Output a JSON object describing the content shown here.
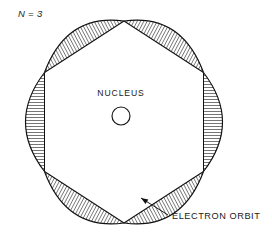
{
  "figure": {
    "title_label": "N = 3",
    "nucleus_label": "NUCLEUS",
    "orbit_label": "ELECTRON ORBIT",
    "background_color": "#ffffff",
    "ink_color": "#111111",
    "hatch_color": "#202020"
  },
  "chart_data": {
    "type": "diagram",
    "title": "N = 3",
    "annotations": [
      "N = 3",
      "NUCLEUS",
      "ELECTRON ORBIT"
    ],
    "wavelengths_around_orbit": 3,
    "lobe_count": 6,
    "polygon_sides": 6,
    "orbit_center": [
      124,
      122
    ],
    "orbit_radius": 101,
    "polygon_rotation_deg": 30,
    "bulge_depth": 19,
    "hatch_spacing": 3.0,
    "nucleus": {
      "center": [
        121,
        116
      ],
      "radius": 9,
      "label": "NUCLEUS",
      "label_position": [
        121,
        96
      ]
    },
    "orbit_callout": {
      "label": "ELECTRON ORBIT",
      "text_position": [
        172,
        219
      ],
      "arrow_from": [
        168,
        215
      ],
      "arrow_to": [
        141,
        198
      ]
    },
    "title_position": [
      18,
      17
    ],
    "vertices": [
      [
        203.5,
        171.5
      ],
      [
        124.0,
        223.0
      ],
      [
        44.5,
        171.5
      ],
      [
        44.5,
        72.5
      ],
      [
        124.0,
        21.0
      ],
      [
        203.5,
        72.5
      ]
    ],
    "hatched_lobes": [
      {
        "index": 0,
        "chord_angle_deg": 0,
        "hatch_direction": "perpendicular-to-chord"
      },
      {
        "index": 1,
        "chord_angle_deg": 60,
        "hatch_direction": "perpendicular-to-chord"
      },
      {
        "index": 2,
        "chord_angle_deg": 120,
        "hatch_direction": "perpendicular-to-chord"
      },
      {
        "index": 3,
        "chord_angle_deg": 180,
        "hatch_direction": "perpendicular-to-chord"
      },
      {
        "index": 4,
        "chord_angle_deg": 240,
        "hatch_direction": "perpendicular-to-chord"
      },
      {
        "index": 5,
        "chord_angle_deg": 300,
        "hatch_direction": "perpendicular-to-chord"
      }
    ]
  }
}
